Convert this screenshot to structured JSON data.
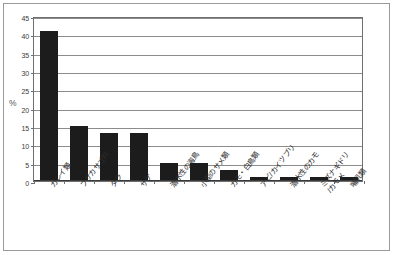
{
  "chart_data": {
    "type": "bar",
    "title": "",
    "xlabel": "",
    "ylabel": "%",
    "ylim": [
      0,
      45
    ],
    "yticks": [
      0,
      5,
      10,
      15,
      20,
      25,
      30,
      35,
      40,
      45
    ],
    "ytick_labels": [
      "0",
      "5",
      "10",
      "15",
      "20",
      "25",
      "30",
      "35",
      "40",
      "45"
    ],
    "grid": true,
    "legend": "none",
    "bar_color": "#1c1c1c",
    "categories": [
      "カレイ類",
      "フサカサゴ科",
      "タラ",
      "サケ",
      "潜水性の海鳥",
      "小型のサメ類",
      "カモ・白鳥類",
      "アビ/カイツブリ",
      "潜水性のカモ",
      "ミズナギドリ\n/カモメ",
      "哺乳類"
    ],
    "values": [
      41,
      15,
      13,
      13,
      5,
      5,
      3,
      1,
      1,
      1,
      1
    ]
  },
  "axis": {
    "y_title": "%"
  }
}
